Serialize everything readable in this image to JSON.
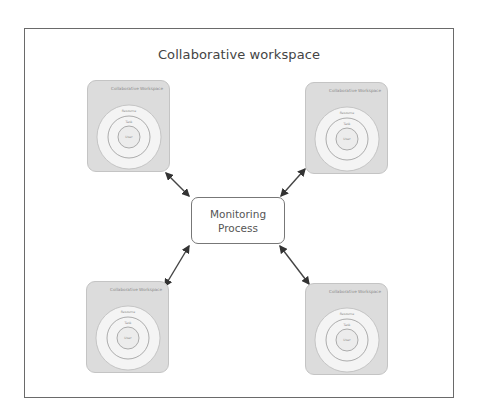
{
  "diagram": {
    "title": "Collaborative workspace",
    "center_node": {
      "line1": "Monitoring",
      "line2": "Process"
    },
    "workspaces": [
      {
        "position": "top-left",
        "title": "Collaborative Workspace",
        "rings": {
          "outer": "Resource",
          "middle": "Task",
          "inner": "User"
        }
      },
      {
        "position": "top-right",
        "title": "Collaborative Workspace",
        "rings": {
          "outer": "Resource",
          "middle": "Task",
          "inner": "User"
        }
      },
      {
        "position": "bottom-left",
        "title": "Collaborative Workspace",
        "rings": {
          "outer": "Resource",
          "middle": "Task",
          "inner": "User"
        }
      },
      {
        "position": "bottom-right",
        "title": "Collaborative Workspace",
        "rings": {
          "outer": "Resource",
          "middle": "Task",
          "inner": "User"
        }
      }
    ],
    "connections": [
      {
        "from": "Monitoring Process",
        "to": "top-left",
        "type": "bidirectional"
      },
      {
        "from": "Monitoring Process",
        "to": "top-right",
        "type": "bidirectional"
      },
      {
        "from": "Monitoring Process",
        "to": "bottom-left",
        "type": "bidirectional"
      },
      {
        "from": "Monitoring Process",
        "to": "bottom-right",
        "type": "bidirectional"
      }
    ],
    "colors": {
      "frame": "#6a6a6a",
      "panel_fill": "#dcdcdc",
      "ring_fill": "#f4f4f4",
      "arrow": "#333333",
      "text": "#444444"
    }
  }
}
